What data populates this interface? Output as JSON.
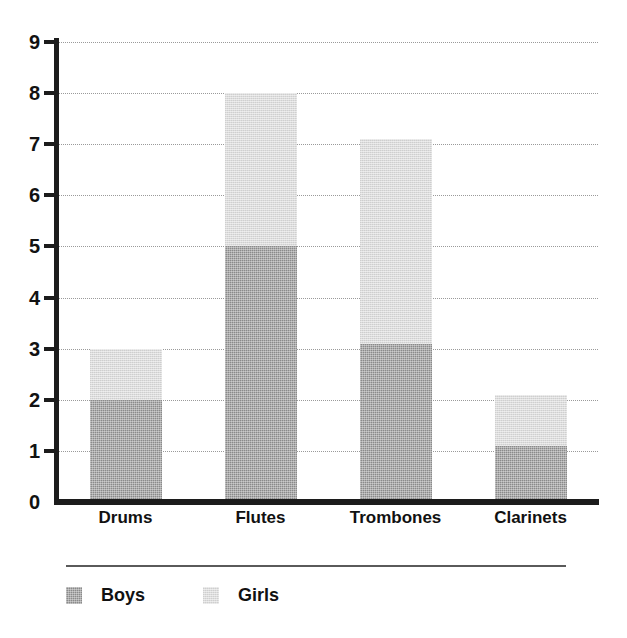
{
  "chart_data": {
    "type": "bar",
    "subtype": "stacked-bar",
    "title": "",
    "xlabel": "",
    "ylabel": "",
    "categories": [
      "Drums",
      "Flutes",
      "Trombones",
      "Clarinets"
    ],
    "series": [
      {
        "name": "Boys",
        "color": "#8a8a8a",
        "values": [
          2,
          5,
          3.1,
          1.1
        ]
      },
      {
        "name": "Girls",
        "color": "#dcdcdc",
        "values": [
          1,
          3,
          4,
          1
        ]
      }
    ],
    "totals": [
      3,
      8,
      7.1,
      2.1
    ],
    "ylim": [
      0,
      9
    ],
    "yticks": [
      0,
      1,
      2,
      3,
      4,
      5,
      6,
      7,
      8,
      9
    ],
    "ytick_labels": [
      "0",
      "1",
      "2",
      "3",
      "4",
      "5",
      "6",
      "7",
      "8",
      "9"
    ],
    "grid": true,
    "grid_style": "dotted",
    "grid_axis": "y",
    "legend_position": "bottom-left",
    "legend_entries": [
      "Boys",
      "Girls"
    ]
  },
  "axis": {
    "y_labels": [
      "9",
      "8",
      "7",
      "6",
      "5",
      "4",
      "3",
      "2",
      "1",
      "0"
    ],
    "x_labels": [
      "Drums",
      "Flutes",
      "Trombones",
      "Clarinets"
    ]
  },
  "legend": {
    "items": [
      {
        "label": "Boys",
        "color": "#8a8a8a"
      },
      {
        "label": "Girls",
        "color": "#dcdcdc"
      }
    ]
  },
  "colors": {
    "boys": "#8a8a8a",
    "girls": "#dcdcdc",
    "axis": "#1c1c1c",
    "grid": "#9a9a9a",
    "text": "#111111",
    "background": "#ffffff"
  }
}
